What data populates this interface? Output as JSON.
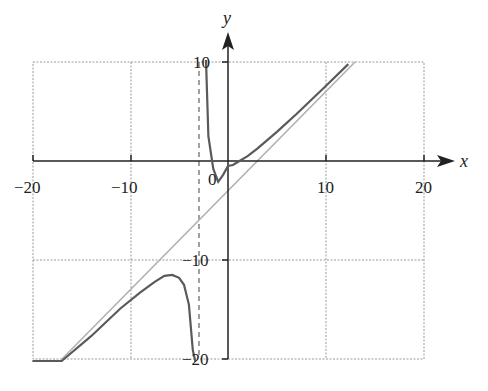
{
  "chart_data": {
    "type": "line",
    "title": "",
    "xlabel": "x",
    "ylabel": "y",
    "xlim": [
      -20,
      20
    ],
    "ylim": [
      -20,
      10
    ],
    "grid": true,
    "x_ticks": [
      "-20",
      "-10",
      "0",
      "10",
      "20"
    ],
    "y_ticks": [
      "10",
      "-10",
      "-20"
    ],
    "origin_label": "0",
    "series": [
      {
        "name": "f(x) = x - 3 + 7.5/(x+3)",
        "style": "solid dark gray",
        "color": "#5a5a5a",
        "branches": [
          {
            "x": [
              -20,
              -17,
              -14,
              -11,
              -9,
              -7.5,
              -6.5,
              -5.7,
              -5,
              -4.5,
              -4,
              -3.6,
              -3.35,
              -3.3
            ],
            "y": [
              -23.4,
              -20.5,
              -17.7,
              -14.9,
              -13.3,
              -12.2,
              -11.6,
              -11.5,
              -11.8,
              -12.5,
              -14.5,
              -19.1,
              -27.8,
              -31.0
            ]
          },
          {
            "x": [
              -2.25,
              -2.0,
              -1.5,
              -1.0,
              -0.5,
              0,
              0.5,
              1,
              2,
              3,
              5,
              7,
              10,
              12.3
            ],
            "y": [
              10.3,
              2.5,
              -0.8,
              -2.1,
              -1.4,
              -0.5,
              -0.4,
              -0.1,
              0.5,
              1.25,
              2.94,
              4.75,
              7.58,
              9.79
            ]
          }
        ]
      },
      {
        "name": "Oblique asymptote y = x - 3",
        "style": "solid light gray",
        "color": "#a8a8a8",
        "x": [
          -17,
          13
        ],
        "y": [
          -20,
          10
        ]
      },
      {
        "name": "Vertical asymptote x = -3",
        "style": "dashed gray",
        "color": "#8a8a8a",
        "x": [
          -3,
          -3
        ],
        "y": [
          -20,
          10
        ]
      }
    ]
  },
  "labels": {
    "x_axis": "x",
    "y_axis": "y",
    "origin": "0",
    "xt_m20": "−20",
    "xt_m10": "−10",
    "xt_10": "10",
    "xt_20": "20",
    "yt_10": "10",
    "yt_m10": "−10",
    "yt_m20": "−20"
  }
}
